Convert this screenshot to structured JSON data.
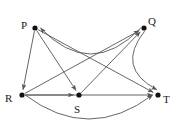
{
  "graph": {
    "type": "directed-graph",
    "stroke_color": "#555555",
    "node_color": "#111111",
    "label_color": "#1a1a1a",
    "background": "#ffffff",
    "nodes": [
      {
        "id": "P",
        "label": "P",
        "x": 35,
        "y": 28,
        "label_x": 21,
        "label_y": 20
      },
      {
        "id": "Q",
        "label": "Q",
        "x": 144,
        "y": 28,
        "label_x": 148,
        "label_y": 16
      },
      {
        "id": "R",
        "label": "R",
        "x": 22,
        "y": 95,
        "label_x": 5,
        "label_y": 93
      },
      {
        "id": "S",
        "label": "S",
        "x": 79,
        "y": 95,
        "label_x": 74,
        "label_y": 104
      },
      {
        "id": "T",
        "label": "T",
        "x": 158,
        "y": 95,
        "label_x": 163,
        "label_y": 94
      }
    ],
    "edges": [
      {
        "from": "Q",
        "to": "P",
        "shape": "arc",
        "curve": -26
      },
      {
        "from": "P",
        "to": "R",
        "shape": "straight",
        "curve": 0
      },
      {
        "from": "P",
        "to": "S",
        "shape": "straight",
        "curve": 0
      },
      {
        "from": "P",
        "to": "T",
        "shape": "straight",
        "curve": 0
      },
      {
        "from": "R",
        "to": "Q",
        "shape": "straight",
        "curve": 0
      },
      {
        "from": "S",
        "to": "Q",
        "shape": "straight",
        "curve": 0
      },
      {
        "from": "R",
        "to": "S",
        "shape": "straight",
        "curve": 0
      },
      {
        "from": "R",
        "to": "T",
        "shape": "straight",
        "curve": 0
      },
      {
        "from": "R",
        "to": "T",
        "shape": "arc",
        "curve": 24
      },
      {
        "from": "Q",
        "to": "T",
        "shape": "arc",
        "curve": 18
      }
    ]
  }
}
